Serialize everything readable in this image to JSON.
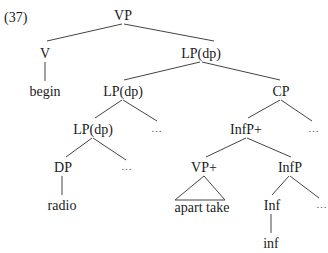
{
  "example_number": "(37)",
  "nodes": {
    "vp": "VP",
    "v": "V",
    "begin": "begin",
    "lp1": "LP(dp)",
    "lp2": "LP(dp)",
    "cp": "CP",
    "lp3": "LP(dp)",
    "ellipsis1": "…",
    "infp_plus": "InfP+",
    "ellipsis2": "…",
    "dp": "DP",
    "ellipsis3": "…",
    "vp_plus": "VP+",
    "infp": "InfP",
    "radio": "radio",
    "apart_take": "apart take",
    "inf_head": "Inf",
    "ellipsis4": "…",
    "inf_word": "inf"
  },
  "edges": [
    [
      "VP",
      "V"
    ],
    [
      "VP",
      "LP(dp)"
    ],
    [
      "V",
      "begin"
    ],
    [
      "LP(dp)",
      "LP(dp)"
    ],
    [
      "LP(dp)",
      "CP"
    ],
    [
      "LP(dp)",
      "LP(dp)"
    ],
    [
      "LP(dp)",
      "…"
    ],
    [
      "CP",
      "InfP+"
    ],
    [
      "CP",
      "…"
    ],
    [
      "LP(dp)",
      "DP"
    ],
    [
      "LP(dp)",
      "…"
    ],
    [
      "InfP+",
      "VP+"
    ],
    [
      "InfP+",
      "InfP"
    ],
    [
      "DP",
      "radio"
    ],
    [
      "VP+",
      "apart take (triangle)"
    ],
    [
      "InfP",
      "Inf"
    ],
    [
      "InfP",
      "…"
    ],
    [
      "Inf",
      "inf"
    ]
  ]
}
